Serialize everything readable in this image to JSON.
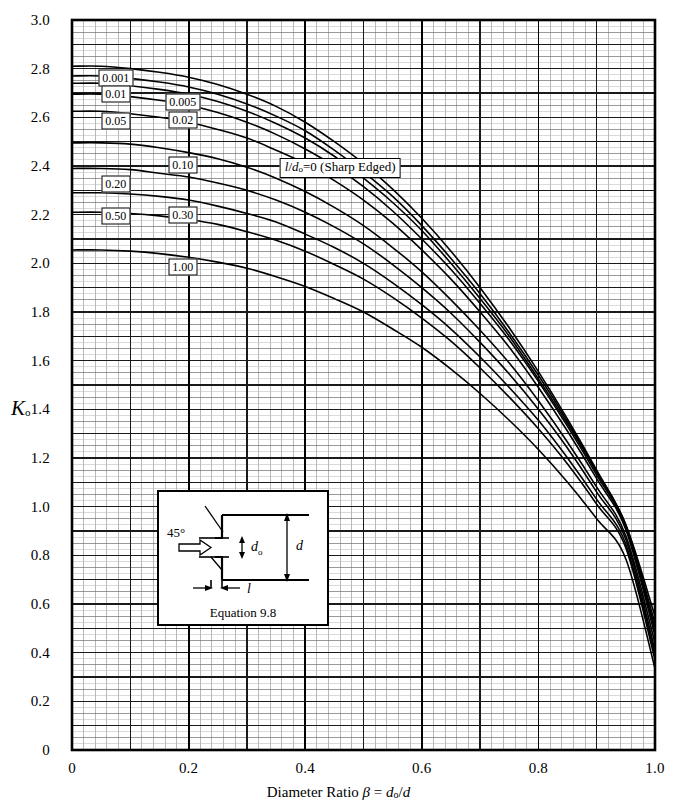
{
  "figure": {
    "y_axis_label": "K",
    "y_axis_label_sub": "o",
    "x_axis_label_prefix": "Diameter Ratio ",
    "x_axis_label_beta": "β",
    "x_axis_label_eq": " = ",
    "x_axis_label_do": "d",
    "x_axis_label_do_sub": "o",
    "x_axis_label_slash": "/",
    "x_axis_label_d": "d",
    "annotation": {
      "l": "l",
      "slash": "/",
      "d": "d",
      "d_sub": "o",
      "eq0": "=0 (Sharp Edged)"
    },
    "inset": {
      "angle": "45°",
      "do_label": "d",
      "do_sub": "o",
      "d_label": "d",
      "l_label": "l",
      "caption": "Equation 9.8"
    }
  },
  "chart_data": {
    "type": "line",
    "title": "",
    "xlabel": "Diameter Ratio β = do/d",
    "ylabel": "Ko",
    "xlim": [
      0,
      1
    ],
    "ylim": [
      0,
      3
    ],
    "grid": true,
    "x_major_step": 0.1,
    "x_minor_step": 0.02,
    "y_major_step": 0.1,
    "y_minor_step": 0.025,
    "xticks": [
      "0",
      "0.2",
      "0.4",
      "0.6",
      "0.8",
      "1.0"
    ],
    "xtick_values": [
      0,
      0.2,
      0.4,
      0.6,
      0.8,
      1.0
    ],
    "yticks": [
      "0",
      "0.2",
      "0.4",
      "0.6",
      "0.8",
      "1.0",
      "1.2",
      "1.4",
      "1.6",
      "1.8",
      "2.0",
      "2.2",
      "2.4",
      "2.6",
      "2.8",
      "3.0"
    ],
    "ytick_values": [
      0,
      0.2,
      0.4,
      0.6,
      0.8,
      1.0,
      1.2,
      1.4,
      1.6,
      1.8,
      2.0,
      2.2,
      2.4,
      2.6,
      2.8,
      3.0
    ],
    "legend_position": "inline-callouts",
    "x": [
      0,
      0.05,
      0.1,
      0.15,
      0.2,
      0.25,
      0.3,
      0.35,
      0.4,
      0.45,
      0.5,
      0.55,
      0.6,
      0.65,
      0.7,
      0.75,
      0.8,
      0.85,
      0.9,
      0.95,
      1.0
    ],
    "series": [
      {
        "name": "0.001",
        "label": "0.001",
        "label_x": 0.075,
        "label_y": 2.76,
        "values": [
          2.81,
          2.81,
          2.8,
          2.785,
          2.765,
          2.735,
          2.695,
          2.645,
          2.58,
          2.5,
          2.41,
          2.305,
          2.185,
          2.05,
          1.9,
          1.735,
          1.555,
          1.36,
          1.15,
          0.925,
          0.55
        ]
      },
      {
        "name": "0.005",
        "label": "0.005",
        "label_x": 0.19,
        "label_y": 2.665,
        "values": [
          2.77,
          2.77,
          2.76,
          2.745,
          2.725,
          2.695,
          2.655,
          2.605,
          2.545,
          2.465,
          2.375,
          2.275,
          2.155,
          2.02,
          1.875,
          1.715,
          1.54,
          1.35,
          1.145,
          0.925,
          0.52
        ]
      },
      {
        "name": "0.01",
        "label": "0.01",
        "label_x": 0.075,
        "label_y": 2.695,
        "values": [
          2.74,
          2.74,
          2.73,
          2.715,
          2.695,
          2.665,
          2.625,
          2.575,
          2.515,
          2.44,
          2.35,
          2.25,
          2.135,
          2.0,
          1.855,
          1.7,
          1.525,
          1.34,
          1.14,
          0.92,
          0.5
        ]
      },
      {
        "name": "0.02",
        "label": "0.02",
        "label_x": 0.19,
        "label_y": 2.59,
        "values": [
          2.695,
          2.695,
          2.685,
          2.67,
          2.65,
          2.62,
          2.58,
          2.53,
          2.47,
          2.4,
          2.315,
          2.215,
          2.1,
          1.975,
          1.835,
          1.685,
          1.515,
          1.33,
          1.13,
          0.915,
          0.49
        ]
      },
      {
        "name": "0.05",
        "label": "0.05",
        "label_x": 0.075,
        "label_y": 2.585,
        "values": [
          2.625,
          2.625,
          2.615,
          2.6,
          2.58,
          2.55,
          2.515,
          2.465,
          2.41,
          2.34,
          2.26,
          2.165,
          2.055,
          1.935,
          1.8,
          1.655,
          1.49,
          1.31,
          1.115,
          0.905,
          0.47
        ]
      },
      {
        "name": "0.10",
        "label": "0.10",
        "label_x": 0.19,
        "label_y": 2.405,
        "values": [
          2.495,
          2.495,
          2.49,
          2.475,
          2.455,
          2.43,
          2.395,
          2.35,
          2.295,
          2.23,
          2.155,
          2.065,
          1.965,
          1.85,
          1.725,
          1.59,
          1.435,
          1.265,
          1.08,
          0.88,
          0.44
        ]
      },
      {
        "name": "0.20",
        "label": "0.20",
        "label_x": 0.075,
        "label_y": 2.325,
        "values": [
          2.39,
          2.39,
          2.385,
          2.37,
          2.355,
          2.33,
          2.3,
          2.26,
          2.21,
          2.15,
          2.08,
          1.995,
          1.9,
          1.795,
          1.675,
          1.545,
          1.4,
          1.24,
          1.06,
          0.865,
          0.41
        ]
      },
      {
        "name": "0.30",
        "label": "0.30",
        "label_x": 0.19,
        "label_y": 2.2,
        "values": [
          2.29,
          2.29,
          2.285,
          2.275,
          2.26,
          2.235,
          2.205,
          2.17,
          2.12,
          2.065,
          2.0,
          1.92,
          1.83,
          1.73,
          1.615,
          1.49,
          1.355,
          1.2,
          1.03,
          0.845,
          0.39
        ]
      },
      {
        "name": "0.50",
        "label": "0.50",
        "label_x": 0.075,
        "label_y": 2.195,
        "values": [
          2.21,
          2.21,
          2.205,
          2.195,
          2.18,
          2.16,
          2.13,
          2.095,
          2.05,
          1.995,
          1.935,
          1.86,
          1.775,
          1.68,
          1.57,
          1.45,
          1.32,
          1.175,
          1.01,
          0.83,
          0.37
        ]
      },
      {
        "name": "1.00",
        "label": "1.00",
        "label_x": 0.19,
        "label_y": 1.985,
        "values": [
          2.055,
          2.055,
          2.05,
          2.04,
          2.025,
          2.005,
          1.98,
          1.945,
          1.905,
          1.855,
          1.8,
          1.73,
          1.655,
          1.565,
          1.465,
          1.355,
          1.235,
          1.1,
          0.95,
          0.785,
          0.335
        ]
      }
    ],
    "annotations": [
      {
        "text": "l/do=0 (Sharp Edged)",
        "x": 0.46,
        "y": 2.39
      }
    ]
  }
}
